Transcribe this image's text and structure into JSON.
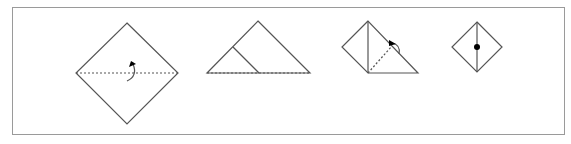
{
  "diagram": {
    "type": "origami-fold-sequence",
    "steps": [
      {
        "index": 1,
        "description": "Square diamond with dotted horizontal valley fold line and fold-up arrow"
      },
      {
        "index": 2,
        "description": "Folded triangle with crease line and dotted base"
      },
      {
        "index": 3,
        "description": "Partially folded shape with dotted fold line and curved arrow"
      },
      {
        "index": 4,
        "description": "Small diamond with vertical center line and dot"
      }
    ],
    "colors": {
      "line": "#555555",
      "frame": "#9a9a9a",
      "dot": "#000000"
    }
  }
}
